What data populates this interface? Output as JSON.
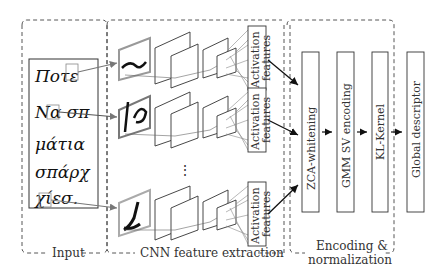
{
  "diagram": {
    "sections": {
      "input": {
        "label": "Input"
      },
      "cnn": {
        "label": "CNN feature extraction"
      },
      "encoding": {
        "label_line1": "Encoding &",
        "label_line2": "normalization"
      }
    },
    "input_words": [
      "Ποτε",
      "Να σπ",
      "μάτια",
      "σπάρχ",
      "χίεσ."
    ],
    "activation_label_line1": "Activation",
    "activation_label_line2": "features",
    "ellipsis": "⋮",
    "pipeline_steps": [
      {
        "label": "ZCA-whitening"
      },
      {
        "label": "GMM SV encoding"
      },
      {
        "label": "KL-Kernel"
      },
      {
        "label": "Global descriptor"
      }
    ]
  }
}
